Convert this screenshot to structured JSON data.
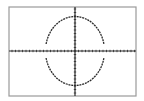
{
  "chart_data": {
    "type": "line",
    "title": "",
    "xlabel": "",
    "ylabel": "",
    "grid": false,
    "axes": {
      "x_ticks_visible": true,
      "y_ticks_visible": true,
      "tick_labels": []
    },
    "series": [
      {
        "name": "upper-half",
        "shape": "ellipse-arc",
        "center": [
          0,
          0
        ],
        "semi_axis_x_ticks": 8.4,
        "semi_axis_y_ticks": 9.7
      },
      {
        "name": "lower-half",
        "shape": "ellipse-arc",
        "center": [
          0,
          0
        ],
        "semi_axis_x_ticks": 8.4,
        "semi_axis_y_ticks": 9.7
      }
    ],
    "pixel_geometry": {
      "frame": {
        "x": 9,
        "y": 7,
        "width": 127,
        "height": 89
      },
      "origin": [
        75,
        51
      ],
      "ellipse_rx": 29.5,
      "ellipse_ry": 34.5,
      "tick_spacing_px": 3.5
    }
  },
  "colors": {
    "background": "#ffffff",
    "frame": "#9a9a9a",
    "axes": "#2a2a2a",
    "curve": "#2a2a2a"
  }
}
